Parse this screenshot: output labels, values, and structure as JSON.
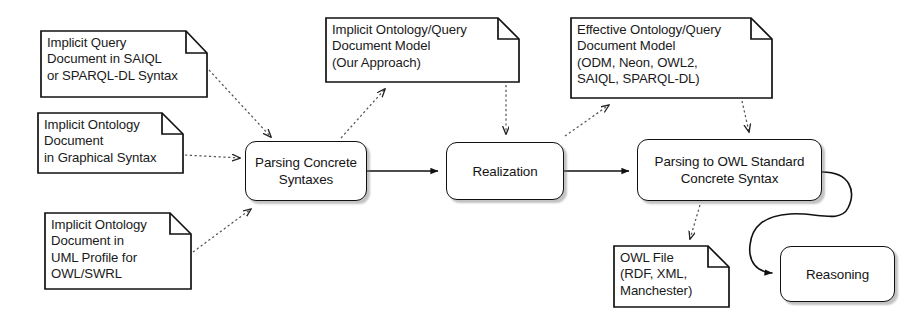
{
  "diagram": {
    "colors": {
      "stroke": "#111111",
      "text": "#1a1a1a",
      "background": "#ffffff",
      "shadow": "#787878",
      "dashed_connector": "#555555"
    },
    "notes": [
      {
        "id": "implicit-query-document",
        "label": "Implicit Query\nDocument in SAIQL\nor SPARQL-DL Syntax",
        "x": 40,
        "y": 30,
        "w": 168,
        "h": 68,
        "fold": 22
      },
      {
        "id": "implicit-ontology-graphical",
        "label": "Implicit Ontology\nDocument\nin Graphical Syntax",
        "x": 37,
        "y": 112,
        "w": 147,
        "h": 62,
        "fold": 22
      },
      {
        "id": "implicit-ontology-uml",
        "label": "Implicit Ontology\nDocument in\nUML Profile for\nOWL/SWRL",
        "x": 44,
        "y": 212,
        "w": 148,
        "h": 78,
        "fold": 22
      },
      {
        "id": "implicit-ontology-query-model",
        "label": "Implicit Ontology/Query\nDocument Model\n(Our Approach)",
        "x": 325,
        "y": 17,
        "w": 195,
        "h": 66,
        "fold": 22
      },
      {
        "id": "effective-ontology-query-model",
        "label": "Effective Ontology/Query\nDocument Model\n(ODM, Neon, OWL2,\nSAIQL, SPARQL-DL)",
        "x": 570,
        "y": 17,
        "w": 203,
        "h": 82,
        "fold": 22
      },
      {
        "id": "owl-file",
        "label": "OWL File\n(RDF, XML,\nManchester)",
        "x": 613,
        "y": 245,
        "w": 117,
        "h": 63,
        "fold": 22
      }
    ],
    "processes": [
      {
        "id": "parsing-concrete-syntaxes",
        "label": "Parsing Concrete\nSyntaxes",
        "x": 245,
        "y": 141,
        "w": 122,
        "h": 60
      },
      {
        "id": "realization",
        "label": "Realization",
        "x": 446,
        "y": 142,
        "w": 118,
        "h": 58
      },
      {
        "id": "parsing-owl-standard",
        "label": "Parsing to OWL Standard\nConcrete Syntax",
        "x": 637,
        "y": 139,
        "w": 185,
        "h": 62
      },
      {
        "id": "reasoning",
        "label": "Reasoning",
        "x": 780,
        "y": 246,
        "w": 115,
        "h": 56
      }
    ],
    "connectors": [
      {
        "id": "query-doc-to-parsing",
        "style": "dashed",
        "from": "implicit-query-document",
        "to": "parsing-concrete-syntaxes"
      },
      {
        "id": "graphical-doc-to-parsing",
        "style": "dashed",
        "from": "implicit-ontology-graphical",
        "to": "parsing-concrete-syntaxes"
      },
      {
        "id": "uml-doc-to-parsing",
        "style": "dashed",
        "from": "implicit-ontology-uml",
        "to": "parsing-concrete-syntaxes"
      },
      {
        "id": "parsing-to-implicit-model",
        "style": "dashed",
        "from": "parsing-concrete-syntaxes",
        "to": "implicit-ontology-query-model"
      },
      {
        "id": "implicit-model-to-realization",
        "style": "dashed",
        "from": "implicit-ontology-query-model",
        "to": "realization"
      },
      {
        "id": "realization-to-effective-model",
        "style": "dashed",
        "from": "realization",
        "to": "effective-ontology-query-model"
      },
      {
        "id": "effective-model-to-parsing-owl",
        "style": "dashed",
        "from": "effective-ontology-query-model",
        "to": "parsing-owl-standard"
      },
      {
        "id": "parsing-owl-to-owl-file",
        "style": "dashed",
        "from": "parsing-owl-standard",
        "to": "owl-file"
      },
      {
        "id": "parsing-to-realization",
        "style": "solid",
        "from": "parsing-concrete-syntaxes",
        "to": "realization"
      },
      {
        "id": "realization-to-parsing-owl",
        "style": "solid",
        "from": "realization",
        "to": "parsing-owl-standard"
      },
      {
        "id": "parsing-owl-to-reasoning",
        "style": "solid-curved",
        "from": "parsing-owl-standard",
        "to": "reasoning"
      }
    ]
  }
}
